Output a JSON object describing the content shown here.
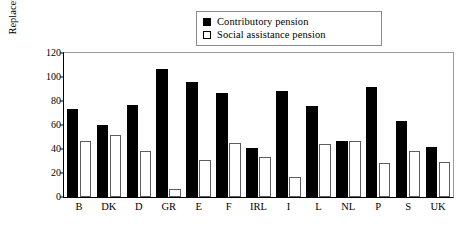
{
  "chart_data": {
    "type": "bar",
    "title": "",
    "subtitle": "",
    "xlabel": "",
    "ylabel": "Replacement rate",
    "ylim": [
      0,
      120
    ],
    "yticks": [
      0,
      20,
      40,
      60,
      80,
      100,
      120
    ],
    "grid": false,
    "legend_position": "top-center",
    "categories": [
      "B",
      "DK",
      "D",
      "GR",
      "E",
      "F",
      "IRL",
      "I",
      "L",
      "NL",
      "P",
      "S",
      "UK"
    ],
    "series": [
      {
        "name": "Contributory pension",
        "color": "#000000",
        "values": [
          73,
          60,
          76.5,
          106.5,
          96,
          87,
          41,
          88,
          76,
          47,
          92,
          63,
          42
        ]
      },
      {
        "name": "Social assistance pension",
        "color": "#ffffff",
        "values": [
          47,
          52,
          38.5,
          7,
          31,
          45,
          33.5,
          17,
          44.5,
          47,
          28,
          38,
          29
        ]
      }
    ]
  },
  "legend": {
    "items": [
      {
        "label": "Contributory pension",
        "swatch": "filled-square-icon"
      },
      {
        "label": "Social assistance pension",
        "swatch": "hollow-square-icon"
      }
    ]
  }
}
